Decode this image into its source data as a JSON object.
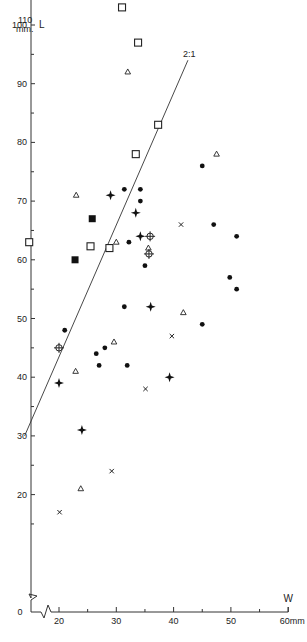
{
  "chart_data": {
    "type": "scatter",
    "title": "",
    "xlabel": "W",
    "ylabel": "L",
    "x_unit": "mm",
    "y_unit": "mm",
    "xlim": [
      14,
      60
    ],
    "ylim": [
      0,
      110
    ],
    "x_ticks": [
      20,
      30,
      40,
      50,
      60
    ],
    "x_tick_labels": [
      "20",
      "30",
      "40",
      "50",
      "60mm"
    ],
    "y_ticks": [
      20,
      30,
      40,
      50,
      60,
      70,
      80,
      90,
      100,
      110
    ],
    "y_tick_labels": [
      "20",
      "30",
      "40",
      "50",
      "60",
      "70",
      "80",
      "90",
      "100",
      "110 mm"
    ],
    "origin_label": "0",
    "grid": false,
    "axis_breaks": true,
    "reference_line": {
      "label": "2:1",
      "from": [
        14,
        30
      ],
      "to": [
        42.5,
        94
      ]
    },
    "series": [
      {
        "name": "open-square",
        "marker": "square-open",
        "points": [
          [
            35,
            107
          ],
          [
            31,
            103
          ],
          [
            33.8,
            97
          ],
          [
            37.3,
            83
          ],
          [
            33.4,
            78
          ],
          [
            14.8,
            63
          ],
          [
            25.5,
            62.3
          ],
          [
            28.8,
            62
          ]
        ]
      },
      {
        "name": "filled-square",
        "marker": "square-filled",
        "points": [
          [
            25.8,
            67
          ],
          [
            22.8,
            60
          ]
        ]
      },
      {
        "name": "open-triangle",
        "marker": "triangle-open",
        "points": [
          [
            32,
            92
          ],
          [
            47.5,
            78
          ],
          [
            23,
            71
          ],
          [
            30,
            63
          ],
          [
            35.6,
            62
          ],
          [
            41.7,
            51
          ],
          [
            29.6,
            46
          ],
          [
            22.9,
            41
          ],
          [
            23.8,
            21
          ]
        ]
      },
      {
        "name": "filled-circle",
        "marker": "circle-filled",
        "points": [
          [
            31.4,
            72
          ],
          [
            34.2,
            72
          ],
          [
            34.2,
            70
          ],
          [
            32.2,
            63
          ],
          [
            45,
            76
          ],
          [
            47,
            66
          ],
          [
            51,
            64
          ],
          [
            35,
            59
          ],
          [
            31.4,
            52
          ],
          [
            21,
            48
          ],
          [
            49.8,
            57
          ],
          [
            51,
            55
          ],
          [
            28,
            45
          ],
          [
            45,
            49
          ],
          [
            26.5,
            44
          ],
          [
            27,
            42
          ],
          [
            31.9,
            42
          ]
        ]
      },
      {
        "name": "four-point-star",
        "marker": "star",
        "points": [
          [
            29,
            71
          ],
          [
            33.4,
            68
          ],
          [
            34.2,
            64
          ],
          [
            36,
            52
          ],
          [
            20,
            39
          ],
          [
            39.3,
            40
          ],
          [
            24,
            31
          ]
        ]
      },
      {
        "name": "circle-cross",
        "marker": "circle-cross",
        "points": [
          [
            35.9,
            64
          ],
          [
            35.7,
            61
          ],
          [
            20,
            45
          ]
        ]
      },
      {
        "name": "cross",
        "marker": "x",
        "points": [
          [
            41.3,
            66
          ],
          [
            39.7,
            47
          ],
          [
            35.1,
            38
          ],
          [
            29.2,
            24
          ],
          [
            20.1,
            17
          ]
        ]
      }
    ]
  },
  "axes": {
    "y_title_top": "110",
    "y_title_unit": "mm.",
    "y_letter": "L",
    "x_letter": "W",
    "x_end": "60mm",
    "ratio_label": "2:1",
    "zero": "0"
  }
}
